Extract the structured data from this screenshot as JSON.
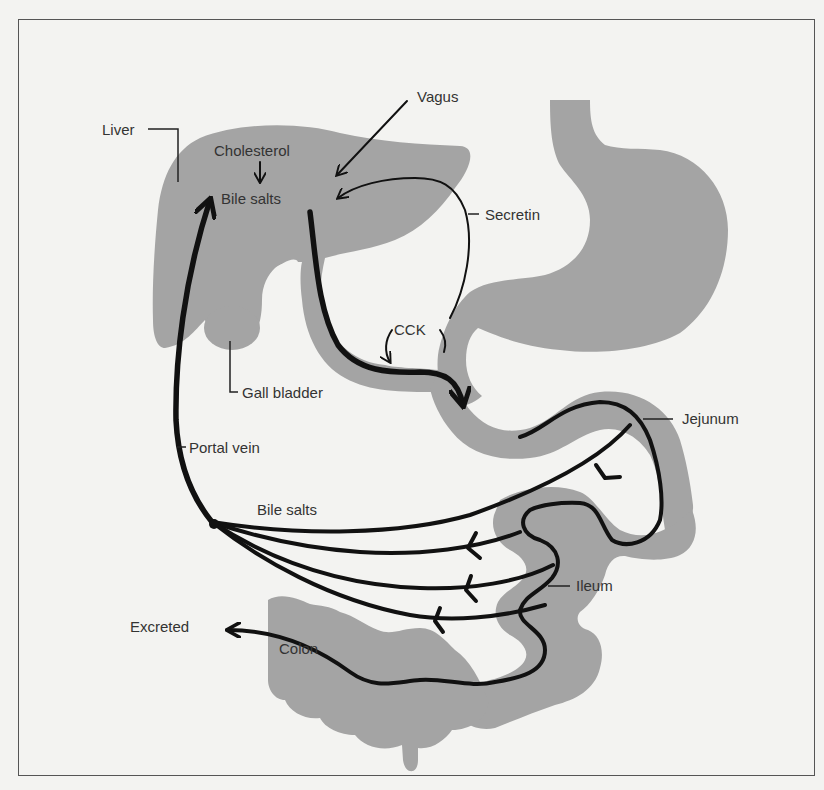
{
  "figure": {
    "labels": {
      "liver": "Liver",
      "cholesterol": "Cholesterol",
      "bile_salts_liver": "Bile salts",
      "vagus": "Vagus",
      "secretin": "Secretin",
      "cck": "CCK",
      "gall_bladder": "Gall bladder",
      "portal_vein": "Portal vein",
      "jejunum": "Jejunum",
      "bile_salts_return": "Bile salts",
      "ileum": "Ileum",
      "excreted": "Excreted",
      "colon": "Colon"
    },
    "colors": {
      "organ_fill": "#a4a4a4",
      "arrow_stroke": "#111111",
      "background": "#f3f3f1"
    }
  }
}
